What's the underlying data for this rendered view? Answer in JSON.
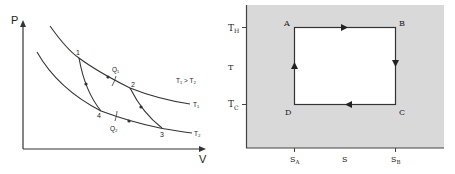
{
  "pv_diagram": {
    "axis_y_label": "P",
    "axis_x_label": "V",
    "points": {
      "p1": "1",
      "p2": "2",
      "p3": "3",
      "p4": "4"
    },
    "heat_in_label": "Q₁",
    "heat_out_label": "Q₂",
    "isotherm_hot_label": "T₁",
    "isotherm_cold_label": "T₂",
    "condition_label": "T₁ > T₂"
  },
  "ts_diagram": {
    "y_tick_high": "T",
    "y_tick_high_sub": "H",
    "y_axis_label": "T",
    "y_tick_low": "T",
    "y_tick_low_sub": "C",
    "x_tick_left": "S",
    "x_tick_left_sub": "A",
    "x_axis_label": "S",
    "x_tick_right": "S",
    "x_tick_right_sub": "B",
    "corners": {
      "a": "A",
      "b": "B",
      "c": "C",
      "d": "D"
    },
    "background_color": "#d9d9d9",
    "inner_color": "#ffffff"
  }
}
